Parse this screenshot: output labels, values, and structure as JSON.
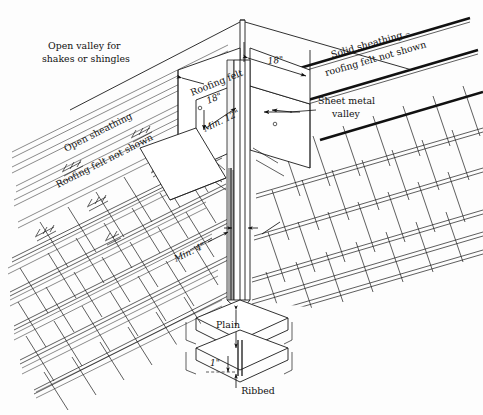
{
  "figure": {
    "background_color": "#fdfdfd",
    "line_color": "#1a1a1a"
  },
  "labels": {
    "open_valley": "Open valley for",
    "open_valley_2": "shakes or shingles",
    "solid_sheathing": "Solid sheathing –",
    "solid_sheathing_2": "roofing felt not shown",
    "sheet_metal": "Sheet metal",
    "sheet_metal_2": "valley",
    "open_sheathing": "Open sheathing",
    "roofing_felt_not_shown": "Roofing felt not shown",
    "roofing_felt": "Roofing felt",
    "roofing_felt_dim": "18\"",
    "min_12": "Min. 12\"",
    "min_4": "Min. 4\"",
    "dim_18": "18\"",
    "plain": "Plain",
    "ribbed": "Ribbed",
    "one_inch": "1\""
  },
  "dimensions": {
    "valley_felt_width": "18\"",
    "sheathing_offset": "18\"",
    "metal_min_lap": "Min. 12\"",
    "shingle_min_clearance": "Min. 4\"",
    "rib_height": "1\""
  },
  "detail_types": {
    "plain": "Plain",
    "ribbed": "Ribbed"
  }
}
